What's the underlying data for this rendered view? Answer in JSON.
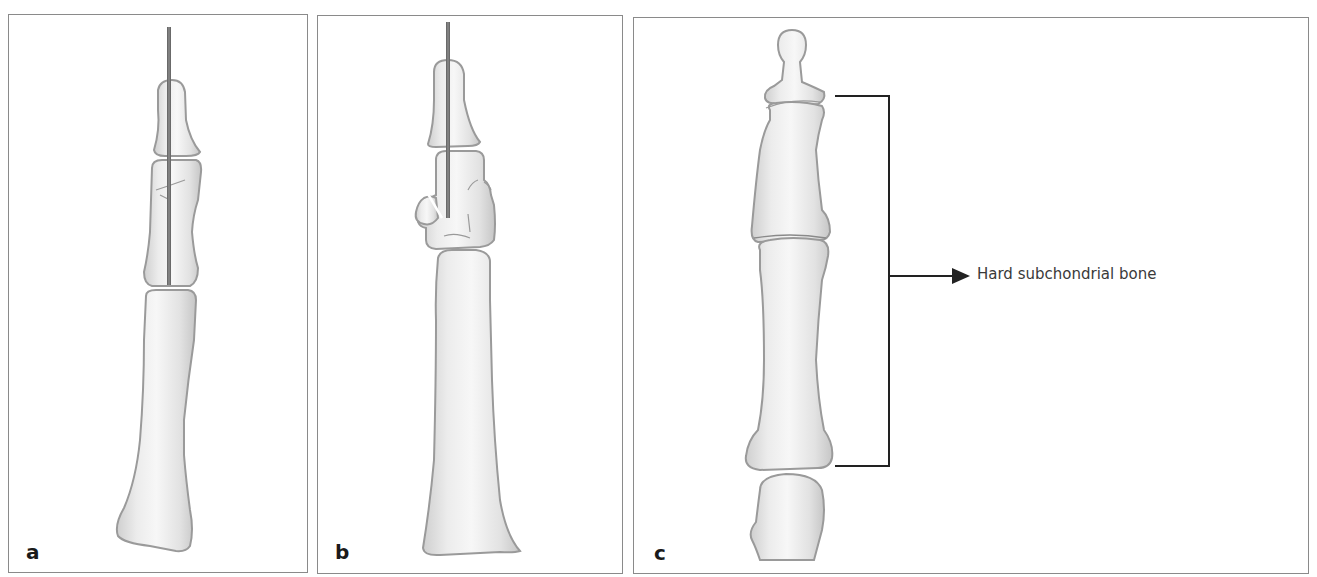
{
  "figure": {
    "panels": [
      {
        "id": "a",
        "letter": "a",
        "description": "Finger bones with longitudinal K-wire through distal and middle phalanges"
      },
      {
        "id": "b",
        "letter": "b",
        "description": "Finger bones with K-wire and fractured, displaced middle phalanx base fragment"
      },
      {
        "id": "c",
        "letter": "c",
        "description": "Normal finger bones with bracket indicating region"
      }
    ],
    "annotation": {
      "label": "Hard subchondrial bone",
      "arrow": "right-arrow"
    },
    "colors": {
      "bone_fill": "#e9e9e9",
      "bone_outline": "#9a9a9a",
      "wire": "#7a7a7a",
      "border": "#8a8a8a",
      "bracket": "#222222"
    }
  }
}
